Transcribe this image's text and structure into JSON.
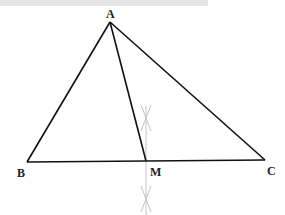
{
  "diagram": {
    "title": "",
    "points": {
      "A": {
        "label": "A",
        "x": 110,
        "y": 22
      },
      "B": {
        "label": "B",
        "x": 27,
        "y": 162
      },
      "C": {
        "label": "C",
        "x": 265,
        "y": 160
      },
      "M": {
        "label": "M",
        "x": 146,
        "y": 161
      }
    },
    "segments": [
      "AB",
      "AC",
      "BC",
      "AM"
    ],
    "construction": "perpendicular bisector of BC through M with compass arcs",
    "colors": {
      "line": "#111111",
      "construction": "#bbbbbb",
      "topbar": "#e6e6e6"
    }
  }
}
